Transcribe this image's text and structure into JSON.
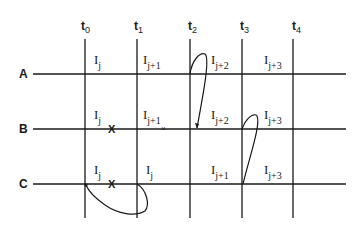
{
  "diagram": {
    "type": "time-interval grid",
    "time_labels": [
      {
        "base": "t",
        "sub": "0"
      },
      {
        "base": "t",
        "sub": "1"
      },
      {
        "base": "t",
        "sub": "2"
      },
      {
        "base": "t",
        "sub": "3"
      },
      {
        "base": "t",
        "sub": "4"
      }
    ],
    "rows": [
      {
        "label": "A",
        "cells": [
          {
            "base": "I",
            "sub": "j"
          },
          {
            "base": "I",
            "sub": "j+1"
          },
          {
            "base": "I",
            "sub": "j+2"
          },
          {
            "base": "I",
            "sub": "j+3"
          }
        ]
      },
      {
        "label": "B",
        "cells": [
          {
            "base": "I",
            "sub": "j"
          },
          {
            "base": "I",
            "sub": "j+1"
          },
          {
            "base": "I",
            "sub": "j+2"
          },
          {
            "base": "I",
            "sub": "j+3"
          }
        ]
      },
      {
        "label": "C",
        "cells": [
          {
            "base": "I",
            "sub": "j"
          },
          {
            "base": "I",
            "sub": "j"
          },
          {
            "base": "I",
            "sub": "j+1"
          },
          {
            "base": "I",
            "sub": "j+3"
          }
        ]
      }
    ],
    "marks": {
      "b_cross_1": "X",
      "b_cross_2": "×",
      "c_cross_1": "X"
    },
    "colors": {
      "ink": "#1a1a1a",
      "background": "#ffffff"
    }
  }
}
